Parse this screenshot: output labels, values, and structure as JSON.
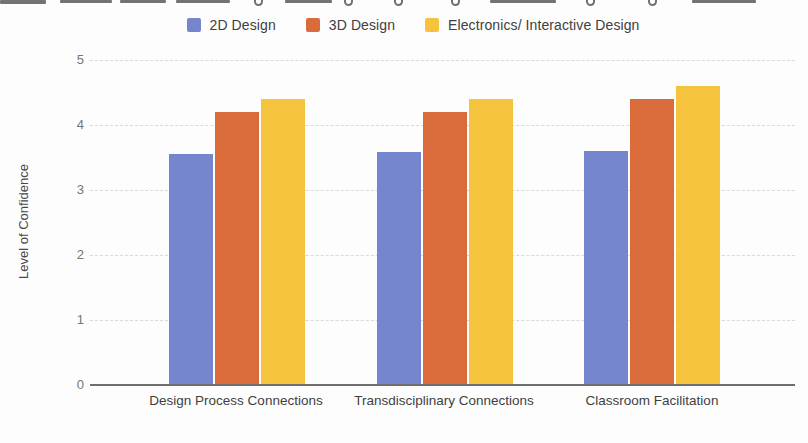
{
  "legend": {
    "items": [
      {
        "label": "2D Design",
        "color": "#7585CE"
      },
      {
        "label": "3D Design",
        "color": "#DA6C3C"
      },
      {
        "label": "Electronics/ Interactive Design",
        "color": "#F6C33E"
      }
    ]
  },
  "y_axis": {
    "title": "Level of Confidence",
    "ticks": [
      "5",
      "4",
      "3",
      "2",
      "1",
      "0"
    ]
  },
  "chart_data": {
    "type": "bar",
    "title": "",
    "categories": [
      "Design Process Connections",
      "Transdisciplinary Connections",
      "Classroom Facilitation"
    ],
    "series": [
      {
        "name": "2D Design",
        "color": "#7585CE",
        "values": [
          3.55,
          3.58,
          3.6
        ]
      },
      {
        "name": "3D Design",
        "color": "#DA6C3C",
        "values": [
          4.2,
          4.2,
          4.4
        ]
      },
      {
        "name": "Electronics/ Interactive Design",
        "color": "#F6C33E",
        "values": [
          4.4,
          4.4,
          4.6
        ]
      }
    ],
    "xlabel": "",
    "ylabel": "Level of Confidence",
    "ylim": [
      0,
      5
    ],
    "yticks": [
      0,
      1,
      2,
      3,
      4,
      5
    ],
    "grid": true,
    "legend_position": "top"
  }
}
